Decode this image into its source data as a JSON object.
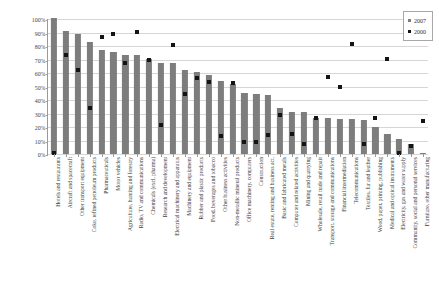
{
  "chart_data": {
    "type": "bar",
    "title": "",
    "subtitle": "",
    "xlabel": "",
    "ylabel": "Inward sectoral R&D intensity",
    "ylim": [
      0,
      100
    ],
    "ytick_labels": [
      "100%",
      "90%",
      "80%",
      "70%",
      "60%",
      "50%",
      "40%",
      "30%",
      "20%",
      "10%",
      "0%"
    ],
    "ytick_values": [
      100,
      90,
      80,
      70,
      60,
      50,
      40,
      30,
      20,
      10,
      0
    ],
    "grid": true,
    "legend_position": "top-right",
    "categories": [
      "Hotels and restaurants",
      "Aircraft and spacecraft",
      "Other transport equipment",
      "Coke, refined petroleum products",
      "Pharmaceuticals",
      "Motor vehicles",
      "Agriculture, hunting and forestry",
      "Radio, TV and communications",
      "Chemicals (excl. pharma)",
      "Research and development",
      "Electrical machinery and apparatus",
      "Machinery and equipment",
      "Rubber and plastic products",
      "Food, beverages and tobacco",
      "Other business activities",
      "Non-metallic mineral products",
      "Office machinery, computers",
      "Construction",
      "Real estate, renting and business act.",
      "Basic and fabricated metals",
      "Computer and related activities",
      "Mining and quarrying",
      "Wholesale, retail trade and repair",
      "Transport, storage and communications",
      "Financial intermediation",
      "Telecommunications",
      "Textiles, fur and leather",
      "Wood, paper, printing, publishing",
      "Medical and optical instruments",
      "Electricity, gas and water supply",
      "Community, social and personal services",
      "Furniture, other manufacturing"
    ],
    "series": [
      {
        "name": "2007",
        "render": "bar",
        "color": "#7d7d7d",
        "values": [
          100,
          90.5,
          88.5,
          82.5,
          76.5,
          75,
          72.5,
          72.5,
          69.5,
          67,
          67,
          62,
          60.5,
          58,
          53.5,
          51.5,
          45,
          44,
          43.5,
          34,
          31,
          31,
          26.5,
          26.5,
          26,
          26,
          25,
          19.5,
          15,
          11,
          7,
          1
        ]
      },
      {
        "name": "2000",
        "render": "marker",
        "color": "#141414",
        "values": [
          0.5,
          72.5,
          62,
          33.5,
          86,
          88,
          67,
          89.5,
          69,
          21,
          80.5,
          44,
          56,
          53,
          13,
          52,
          8.5,
          8.5,
          14,
          28.5,
          15,
          7.5,
          26.5,
          56.5,
          49,
          81,
          7.5,
          26.5,
          69.5,
          0.5,
          6,
          24.5
        ]
      }
    ],
    "legend": [
      {
        "label": "2007",
        "color": "#7d7d7d"
      },
      {
        "label": "2000",
        "color": "#141414"
      }
    ]
  }
}
